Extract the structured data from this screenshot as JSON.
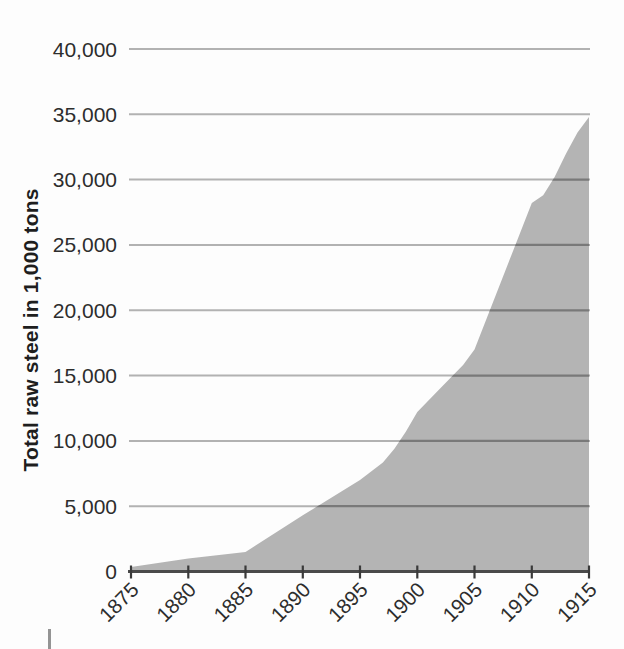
{
  "chart_data": {
    "type": "area",
    "title": "",
    "xlabel": "",
    "ylabel": "Total raw steel in 1,000 tons",
    "x_tick_labels": [
      "1875",
      "1880",
      "1885",
      "1890",
      "1895",
      "1900",
      "1905",
      "1910",
      "1915"
    ],
    "y_tick_labels": [
      "0",
      "5,000",
      "10,000",
      "15,000",
      "20,000",
      "25,000",
      "30,000",
      "35,000",
      "40,000"
    ],
    "xlim": [
      1875,
      1915
    ],
    "ylim": [
      0,
      40000
    ],
    "y_tick_step": 5000,
    "grid": "horizontal",
    "legend": "none",
    "categories": [
      1875,
      1880,
      1885,
      1890,
      1895,
      1900,
      1905,
      1910,
      1915
    ],
    "values": [
      350,
      1000,
      1500,
      4300,
      7000,
      12200,
      17000,
      28200,
      34800
    ],
    "curve_points": [
      [
        1875,
        350
      ],
      [
        1880,
        1000
      ],
      [
        1885,
        1500
      ],
      [
        1890,
        4300
      ],
      [
        1895,
        7000
      ],
      [
        1897,
        8350
      ],
      [
        1898,
        9400
      ],
      [
        1899,
        10700
      ],
      [
        1900,
        12200
      ],
      [
        1902,
        14000
      ],
      [
        1904,
        15800
      ],
      [
        1905,
        17000
      ],
      [
        1910,
        28200
      ],
      [
        1911,
        28800
      ],
      [
        1912,
        30200
      ],
      [
        1913,
        32000
      ],
      [
        1914,
        33600
      ],
      [
        1915,
        34800
      ]
    ],
    "colors": {
      "area_fill": "#b4b4b4",
      "grid_light": "#b2b2b2",
      "grid_dark": "#797979",
      "axis_line": "#4a4a4a",
      "tick": "#3a3a3a",
      "text": "#2d2d2d"
    }
  }
}
